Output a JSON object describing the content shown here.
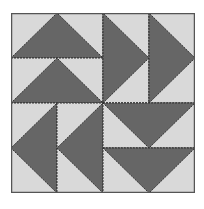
{
  "block": {
    "name": "Dutchman's Puzzle quilt block",
    "colors": {
      "light": "#d9d9d9",
      "dark": "#666666",
      "stitch": "#333333",
      "border": "#555555"
    },
    "quadrants": [
      {
        "position": "top-left",
        "orientation": "horizontal",
        "direction": "up",
        "units": 2
      },
      {
        "position": "top-right",
        "orientation": "vertical",
        "direction": "right",
        "units": 2
      },
      {
        "position": "bottom-left",
        "orientation": "vertical",
        "direction": "left",
        "units": 2
      },
      {
        "position": "bottom-right",
        "orientation": "horizontal",
        "direction": "down",
        "units": 2
      }
    ]
  }
}
